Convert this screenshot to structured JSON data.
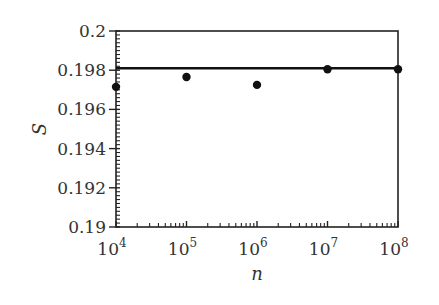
{
  "chart_data": {
    "type": "scatter",
    "title": "",
    "xlabel": "n",
    "ylabel": "S",
    "xscale": "log",
    "xlim": [
      10000,
      100000000
    ],
    "ylim": [
      0.19,
      0.2
    ],
    "xticks": [
      "10^4",
      "10^5",
      "10^6",
      "10^7",
      "10^8"
    ],
    "yticks": [
      "0.19",
      "0.192",
      "0.194",
      "0.196",
      "0.198",
      "0.2"
    ],
    "grid": false,
    "legend": null,
    "series": [
      {
        "name": "simulation",
        "style": "markers",
        "x": [
          10000,
          100000,
          1000000,
          10000000,
          100000000
        ],
        "values": [
          0.19715,
          0.19765,
          0.19725,
          0.19805,
          0.19805
        ]
      },
      {
        "name": "reference",
        "style": "horizontal-line",
        "value": 0.1981
      }
    ]
  }
}
